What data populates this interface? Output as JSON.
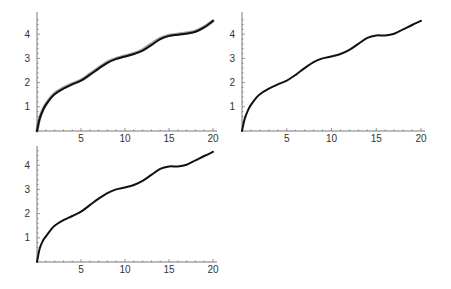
{
  "layout": {
    "width": 451,
    "height": 289
  },
  "style": {
    "axis_color": "#555555",
    "curve_color": "#111111",
    "overlay_color": "#7a7a7a",
    "tick_label_color": "#333333"
  },
  "chart_data": [
    {
      "id": "top-left",
      "type": "line",
      "title": "",
      "xlabel": "",
      "ylabel": "",
      "xlim": [
        0,
        20
      ],
      "ylim": [
        0,
        4.6
      ],
      "grid": false,
      "xticks": [
        5,
        10,
        15,
        20
      ],
      "yticks": [
        1,
        2,
        3,
        4
      ],
      "frame": {
        "x0": 37,
        "x1": 213,
        "y0": 131,
        "ypx_per_unit": 24.2,
        "ytop": 12
      },
      "series": [
        {
          "name": "curve-exact",
          "style": "overlay",
          "x": [
            0,
            0.3,
            0.7,
            1,
            1.5,
            2,
            3,
            4,
            5,
            6,
            7,
            8,
            9,
            10,
            11,
            12,
            13,
            14,
            15,
            16,
            17,
            18,
            19,
            20
          ],
          "y": [
            0,
            0.55,
            0.9,
            1.1,
            1.35,
            1.55,
            1.78,
            1.95,
            2.1,
            2.35,
            2.6,
            2.85,
            3.0,
            3.1,
            3.2,
            3.35,
            3.6,
            3.82,
            3.95,
            4.0,
            4.05,
            4.12,
            4.3,
            4.55
          ]
        },
        {
          "name": "curve-approx",
          "style": "main",
          "x": [
            0,
            0.3,
            0.7,
            1,
            1.5,
            2,
            3,
            4,
            5,
            6,
            7,
            8,
            9,
            10,
            11,
            12,
            13,
            14,
            15,
            16,
            17,
            18,
            19,
            20
          ],
          "y": [
            0,
            0.5,
            0.88,
            1.08,
            1.33,
            1.52,
            1.75,
            1.93,
            2.08,
            2.32,
            2.58,
            2.82,
            2.98,
            3.08,
            3.18,
            3.32,
            3.55,
            3.8,
            3.93,
            3.98,
            4.03,
            4.1,
            4.28,
            4.55
          ]
        }
      ]
    },
    {
      "id": "top-right",
      "type": "line",
      "title": "",
      "xlabel": "",
      "ylabel": "",
      "xlim": [
        0,
        20
      ],
      "ylim": [
        0,
        4.6
      ],
      "grid": false,
      "xticks": [
        5,
        10,
        15,
        20
      ],
      "yticks": [
        1,
        2,
        3,
        4
      ],
      "frame": {
        "x0": 242,
        "x1": 421,
        "y0": 131,
        "ypx_per_unit": 24.2,
        "ytop": 12
      },
      "series": [
        {
          "name": "curve",
          "style": "main",
          "x": [
            0,
            0.3,
            0.7,
            1,
            1.5,
            2,
            3,
            4,
            5,
            6,
            7,
            8,
            9,
            10,
            11,
            12,
            13,
            14,
            15,
            16,
            17,
            18,
            19,
            20
          ],
          "y": [
            0,
            0.5,
            0.88,
            1.08,
            1.33,
            1.52,
            1.75,
            1.93,
            2.08,
            2.32,
            2.6,
            2.85,
            3.0,
            3.08,
            3.18,
            3.35,
            3.6,
            3.85,
            3.95,
            3.95,
            4.02,
            4.2,
            4.38,
            4.55
          ]
        }
      ]
    },
    {
      "id": "bottom-left",
      "type": "line",
      "title": "",
      "xlabel": "",
      "ylabel": "",
      "xlim": [
        0,
        20
      ],
      "ylim": [
        0,
        4.6
      ],
      "grid": false,
      "xticks": [
        5,
        10,
        15,
        20
      ],
      "yticks": [
        1,
        2,
        3,
        4
      ],
      "frame": {
        "x0": 37,
        "x1": 213,
        "y0": 262,
        "ypx_per_unit": 24.2,
        "ytop": 146
      },
      "series": [
        {
          "name": "curve",
          "style": "main",
          "x": [
            0,
            0.3,
            0.7,
            1,
            1.5,
            2,
            3,
            4,
            5,
            6,
            7,
            8,
            9,
            10,
            11,
            12,
            13,
            14,
            15,
            16,
            17,
            18,
            19,
            20
          ],
          "y": [
            0,
            0.55,
            0.9,
            1.05,
            1.3,
            1.5,
            1.73,
            1.9,
            2.08,
            2.35,
            2.62,
            2.85,
            3.0,
            3.08,
            3.18,
            3.35,
            3.6,
            3.85,
            3.95,
            3.95,
            4.02,
            4.2,
            4.38,
            4.55
          ]
        }
      ]
    }
  ]
}
